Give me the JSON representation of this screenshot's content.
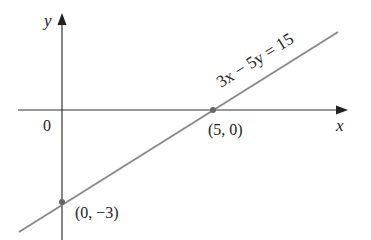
{
  "diagram": {
    "type": "line-graph",
    "axes": {
      "x_label": "x",
      "y_label": "y",
      "origin_label": "0"
    },
    "line": {
      "equation": "3x − 5y = 15",
      "color": "#8a8a8a"
    },
    "points": [
      {
        "label": "(5, 0)",
        "x": 5,
        "y": 0
      },
      {
        "label": "(0, −3)",
        "x": 0,
        "y": -3
      }
    ],
    "colors": {
      "axis": "#333333",
      "line": "#8a8a8a",
      "point": "#666666",
      "text": "#222222"
    }
  }
}
